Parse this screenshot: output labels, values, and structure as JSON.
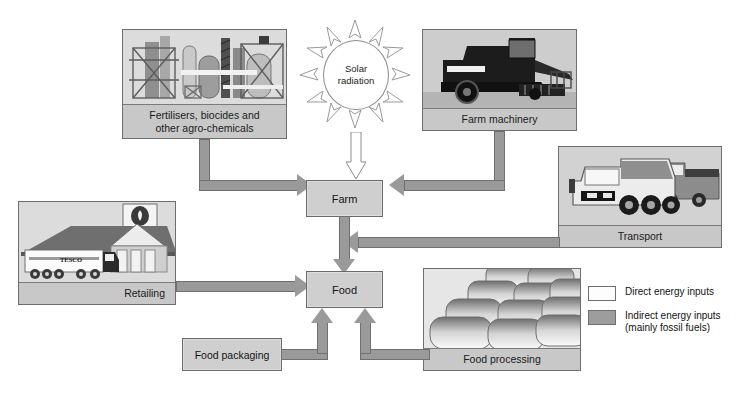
{
  "diagram": {
    "type": "flow-diagram"
  },
  "solar": {
    "line1": "Solar",
    "line2": "radiation",
    "icon": "sun-icon",
    "rays": 12
  },
  "panels": [
    {
      "id": "fertilisers",
      "caption_line1": "Fertilisers, biocides and",
      "caption_line2": "other agro-chemicals",
      "art": "chemical-plant"
    },
    {
      "id": "farm-machinery",
      "caption_line1": "Farm machinery",
      "caption_line2": "",
      "art": "combine-harvester"
    },
    {
      "id": "transport",
      "caption_line1": "Transport",
      "caption_line2": "",
      "art": "trucks"
    },
    {
      "id": "retailing",
      "caption_line1": "Retailing",
      "caption_line2": "",
      "art": "tesco-store",
      "brand": "TESCO",
      "truck_brand": "TESCO"
    },
    {
      "id": "food-processing",
      "caption_line1": "Food processing",
      "caption_line2": "",
      "art": "bread-loaves"
    }
  ],
  "nodes": [
    {
      "id": "farm",
      "label": "Farm"
    },
    {
      "id": "food",
      "label": "Food"
    },
    {
      "id": "food-packaging",
      "label": "Food packaging"
    }
  ],
  "legend": {
    "items": [
      {
        "swatch": "direct",
        "line1": "Direct energy inputs",
        "line2": ""
      },
      {
        "swatch": "indirect",
        "line1": "Indirect energy inputs",
        "line2": "(mainly fossil fuels)"
      }
    ]
  },
  "colors": {
    "direct_swatch": "#fdfdfd",
    "indirect_swatch": "#9d9d9d",
    "arrow": "#9a9a9a",
    "node_fill": "#cfcfcf",
    "caption_fill": "#c8c8c8",
    "border": "#6f6f6f",
    "background": "#ffffff"
  },
  "flows": [
    {
      "from": "fertilisers",
      "to": "farm",
      "kind": "indirect"
    },
    {
      "from": "farm-machinery",
      "to": "farm",
      "kind": "indirect"
    },
    {
      "from": "solar",
      "to": "farm",
      "kind": "direct"
    },
    {
      "from": "transport",
      "to": "farm",
      "kind": "indirect"
    },
    {
      "from": "farm",
      "to": "food",
      "kind": "indirect"
    },
    {
      "from": "retailing",
      "to": "food",
      "kind": "indirect"
    },
    {
      "from": "food-packaging",
      "to": "food",
      "kind": "indirect"
    },
    {
      "from": "food-processing",
      "to": "food",
      "kind": "indirect"
    }
  ]
}
